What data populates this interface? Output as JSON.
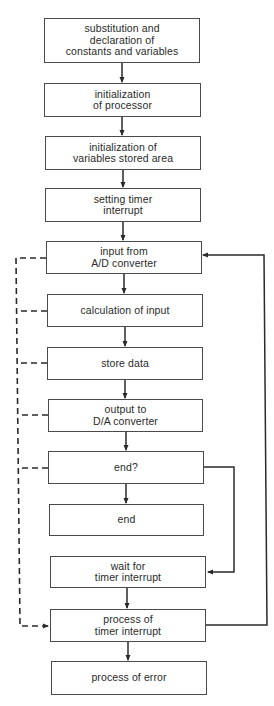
{
  "flowchart": {
    "nodes": [
      {
        "id": "n1",
        "label": "substitution and\ndeclaration of\nconstants and variables"
      },
      {
        "id": "n2",
        "label": "initialization\nof processor"
      },
      {
        "id": "n3",
        "label": "initialization of\nvariables stored area"
      },
      {
        "id": "n4",
        "label": "setting timer\ninterrupt"
      },
      {
        "id": "n5",
        "label": "input from\nA/D converter"
      },
      {
        "id": "n6",
        "label": "calculation of input"
      },
      {
        "id": "n7",
        "label": "store data"
      },
      {
        "id": "n8",
        "label": "output to\nD/A converter"
      },
      {
        "id": "n9",
        "label": "end?"
      },
      {
        "id": "n10",
        "label": "end"
      },
      {
        "id": "n11",
        "label": "wait for\ntimer interrupt"
      },
      {
        "id": "n12",
        "label": "process of\ntimer interrupt"
      },
      {
        "id": "n13",
        "label": "process of error"
      }
    ],
    "edges": [
      {
        "from": "n1",
        "to": "n2",
        "style": "solid"
      },
      {
        "from": "n2",
        "to": "n3",
        "style": "solid"
      },
      {
        "from": "n3",
        "to": "n4",
        "style": "solid"
      },
      {
        "from": "n4",
        "to": "n5",
        "style": "solid"
      },
      {
        "from": "n5",
        "to": "n6",
        "style": "solid"
      },
      {
        "from": "n6",
        "to": "n7",
        "style": "solid"
      },
      {
        "from": "n7",
        "to": "n8",
        "style": "solid"
      },
      {
        "from": "n8",
        "to": "n9",
        "style": "solid"
      },
      {
        "from": "n9",
        "to": "n10",
        "style": "solid"
      },
      {
        "from": "n9",
        "to": "n11",
        "style": "solid"
      },
      {
        "from": "n11",
        "to": "n12",
        "style": "solid"
      },
      {
        "from": "n12",
        "to": "n13",
        "style": "solid"
      },
      {
        "from": "n12",
        "to": "n5",
        "style": "solid"
      },
      {
        "from": "n5",
        "to": "n12",
        "style": "dashed"
      },
      {
        "from": "n6",
        "to": "n12",
        "style": "dashed"
      },
      {
        "from": "n7",
        "to": "n12",
        "style": "dashed"
      },
      {
        "from": "n8",
        "to": "n12",
        "style": "dashed"
      },
      {
        "from": "n9",
        "to": "n12",
        "style": "dashed"
      }
    ]
  }
}
